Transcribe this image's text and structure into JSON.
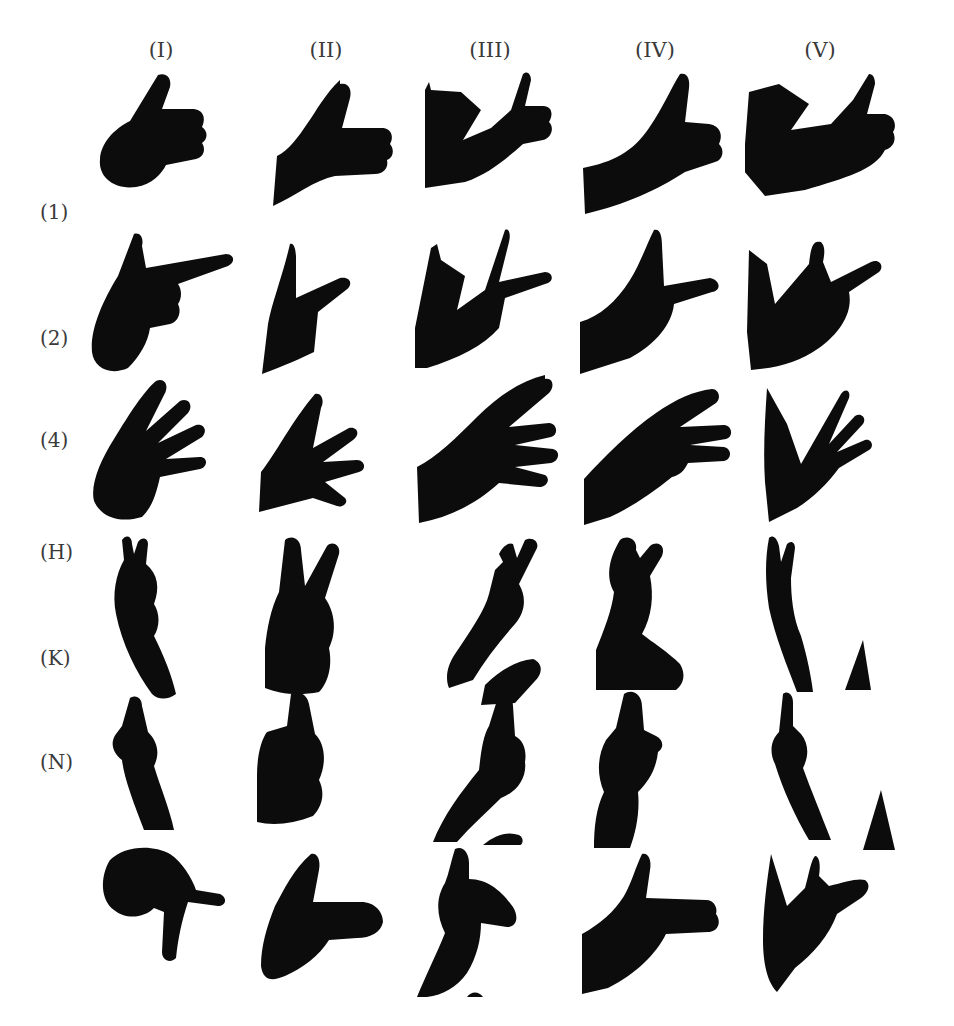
{
  "figure": {
    "columns": [
      {
        "label": "(I)",
        "x": 161
      },
      {
        "label": "(II)",
        "x": 326
      },
      {
        "label": "(III)",
        "x": 490
      },
      {
        "label": "(IV)",
        "x": 655
      },
      {
        "label": "(V)",
        "x": 820
      }
    ],
    "rows": [
      {
        "label": "(1)",
        "y": 212,
        "gesture": "thumbs-up"
      },
      {
        "label": "(2)",
        "y": 338,
        "gesture": "pointing-gun"
      },
      {
        "label": "(4)",
        "y": 440,
        "gesture": "four-fingers"
      },
      {
        "label": "(H)",
        "y": 552,
        "gesture": "two-fingers-h"
      },
      {
        "label": "(K)",
        "y": 658,
        "gesture": "two-fingers-k"
      },
      {
        "label": "(N)",
        "y": 762,
        "gesture": "two-fingers-n"
      }
    ],
    "cells": [
      {
        "row": 0,
        "col": 0,
        "x": 90,
        "y": 70
      },
      {
        "row": 0,
        "col": 1,
        "x": 255,
        "y": 80
      },
      {
        "row": 0,
        "col": 2,
        "x": 415,
        "y": 72
      },
      {
        "row": 0,
        "col": 3,
        "x": 580,
        "y": 72
      },
      {
        "row": 0,
        "col": 4,
        "x": 745,
        "y": 72
      },
      {
        "row": 1,
        "col": 0,
        "x": 90,
        "y": 230
      },
      {
        "row": 1,
        "col": 1,
        "x": 255,
        "y": 240
      },
      {
        "row": 1,
        "col": 2,
        "x": 415,
        "y": 228
      },
      {
        "row": 1,
        "col": 3,
        "x": 580,
        "y": 228
      },
      {
        "row": 1,
        "col": 4,
        "x": 745,
        "y": 240
      },
      {
        "row": 2,
        "col": 0,
        "x": 90,
        "y": 375
      },
      {
        "row": 2,
        "col": 1,
        "x": 255,
        "y": 390
      },
      {
        "row": 2,
        "col": 2,
        "x": 415,
        "y": 375
      },
      {
        "row": 2,
        "col": 3,
        "x": 580,
        "y": 385
      },
      {
        "row": 2,
        "col": 4,
        "x": 745,
        "y": 380
      },
      {
        "row": 3,
        "col": 0,
        "x": 90,
        "y": 530
      },
      {
        "row": 3,
        "col": 1,
        "x": 255,
        "y": 530
      },
      {
        "row": 3,
        "col": 2,
        "x": 415,
        "y": 530
      },
      {
        "row": 3,
        "col": 3,
        "x": 580,
        "y": 530
      },
      {
        "row": 3,
        "col": 4,
        "x": 745,
        "y": 530
      },
      {
        "row": 4,
        "col": 0,
        "x": 90,
        "y": 690
      },
      {
        "row": 4,
        "col": 1,
        "x": 255,
        "y": 690
      },
      {
        "row": 4,
        "col": 2,
        "x": 415,
        "y": 690
      },
      {
        "row": 4,
        "col": 3,
        "x": 580,
        "y": 690
      },
      {
        "row": 4,
        "col": 4,
        "x": 745,
        "y": 690
      },
      {
        "row": 5,
        "col": 0,
        "x": 90,
        "y": 840
      },
      {
        "row": 5,
        "col": 1,
        "x": 255,
        "y": 850
      },
      {
        "row": 5,
        "col": 2,
        "x": 415,
        "y": 845
      },
      {
        "row": 5,
        "col": 3,
        "x": 580,
        "y": 850
      },
      {
        "row": 5,
        "col": 4,
        "x": 745,
        "y": 850
      }
    ],
    "ink_color": "#0c0c0c"
  }
}
